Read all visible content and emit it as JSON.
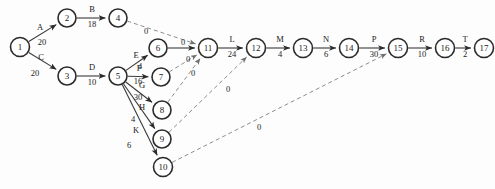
{
  "diagram": {
    "type": "aoa-network",
    "canvas": {
      "width": 495,
      "height": 189
    },
    "colors": {
      "background": "#fdfdfd",
      "node_stroke": "#2b2b2b",
      "node_fill": "#ffffff",
      "edge": "#3a3a3a",
      "dummy_edge": "#8d8d8d",
      "text": "#1a1a1a"
    }
  },
  "nodes": [
    {
      "id": "1",
      "label": "1",
      "x": 20,
      "y": 47,
      "r": 9.5
    },
    {
      "id": "2",
      "label": "2",
      "x": 67,
      "y": 18,
      "r": 9.0
    },
    {
      "id": "3",
      "label": "3",
      "x": 67,
      "y": 76,
      "r": 9.0
    },
    {
      "id": "4",
      "label": "4",
      "x": 118,
      "y": 18,
      "r": 9.0
    },
    {
      "id": "5",
      "label": "5",
      "x": 118,
      "y": 76,
      "r": 9.0
    },
    {
      "id": "6",
      "label": "6",
      "x": 158,
      "y": 48,
      "r": 9.0
    },
    {
      "id": "7",
      "label": "7",
      "x": 161,
      "y": 77,
      "r": 9.0
    },
    {
      "id": "8",
      "label": "8",
      "x": 162,
      "y": 110,
      "r": 9.0
    },
    {
      "id": "9",
      "label": "9",
      "x": 162,
      "y": 139,
      "r": 9.0
    },
    {
      "id": "10",
      "label": "10",
      "x": 163,
      "y": 167,
      "r": 9.5
    },
    {
      "id": "11",
      "label": "11",
      "x": 208,
      "y": 48,
      "r": 9.5
    },
    {
      "id": "12",
      "label": "12",
      "x": 256,
      "y": 48,
      "r": 9.5
    },
    {
      "id": "13",
      "label": "13",
      "x": 303,
      "y": 48,
      "r": 9.5
    },
    {
      "id": "14",
      "label": "14",
      "x": 349,
      "y": 48,
      "r": 9.5
    },
    {
      "id": "15",
      "label": "15",
      "x": 398,
      "y": 48,
      "r": 9.5
    },
    {
      "id": "16",
      "label": "16",
      "x": 445,
      "y": 48,
      "r": 9.5
    },
    {
      "id": "17",
      "label": "17",
      "x": 484,
      "y": 48,
      "r": 9.5
    }
  ],
  "edges": [
    {
      "id": "A",
      "from": "1",
      "to": "2",
      "name": "A",
      "duration": "20",
      "dummy": false,
      "name_x": 40,
      "name_y": 30,
      "dur_x": 42,
      "dur_y": 45
    },
    {
      "id": "B",
      "from": "2",
      "to": "4",
      "name": "B",
      "duration": "18",
      "dummy": false,
      "name_x": 92,
      "name_y": 12,
      "dur_x": 92,
      "dur_y": 27
    },
    {
      "id": "C",
      "from": "1",
      "to": "3",
      "name": "C",
      "duration": "20",
      "dummy": false,
      "name_x": 41,
      "name_y": 60,
      "dur_x": 35,
      "dur_y": 76
    },
    {
      "id": "D",
      "from": "3",
      "to": "5",
      "name": "D",
      "duration": "10",
      "dummy": false,
      "name_x": 92,
      "name_y": 70,
      "dur_x": 92,
      "dur_y": 85
    },
    {
      "id": "E",
      "from": "5",
      "to": "6",
      "name": "E",
      "duration": "4",
      "dummy": false,
      "name_x": 136,
      "name_y": 58,
      "dur_x": 140,
      "dur_y": 69
    },
    {
      "id": "F",
      "from": "5",
      "to": "7",
      "name": "F",
      "duration": "16",
      "dummy": false,
      "name_x": 139,
      "name_y": 71,
      "dur_x": 138,
      "dur_y": 84
    },
    {
      "id": "G",
      "from": "5",
      "to": "8",
      "name": "G",
      "duration": "30",
      "dummy": false,
      "name_x": 142,
      "name_y": 88,
      "dur_x": 138,
      "dur_y": 100
    },
    {
      "id": "H",
      "from": "5",
      "to": "9",
      "name": "H",
      "duration": "4",
      "dummy": false,
      "name_x": 142,
      "name_y": 110,
      "dur_x": 133,
      "dur_y": 122
    },
    {
      "id": "K",
      "from": "5",
      "to": "10",
      "name": "K",
      "duration": "6",
      "dummy": false,
      "name_x": 136,
      "name_y": 133,
      "dur_x": 129,
      "dur_y": 148
    },
    {
      "id": "L",
      "from": "11",
      "to": "12",
      "name": "L",
      "duration": "24",
      "dummy": false,
      "name_x": 232,
      "name_y": 42,
      "dur_x": 232,
      "dur_y": 57
    },
    {
      "id": "M",
      "from": "12",
      "to": "13",
      "name": "M",
      "duration": "4",
      "dummy": false,
      "name_x": 280,
      "name_y": 42,
      "dur_x": 280,
      "dur_y": 57
    },
    {
      "id": "N",
      "from": "13",
      "to": "14",
      "name": "N",
      "duration": "6",
      "dummy": false,
      "name_x": 326,
      "name_y": 42,
      "dur_x": 326,
      "dur_y": 57
    },
    {
      "id": "P",
      "from": "14",
      "to": "15",
      "name": "P",
      "duration": "30",
      "dummy": false,
      "name_x": 374,
      "name_y": 42,
      "dur_x": 374,
      "dur_y": 57
    },
    {
      "id": "R",
      "from": "15",
      "to": "16",
      "name": "R",
      "duration": "10",
      "dummy": false,
      "name_x": 422,
      "name_y": 42,
      "dur_x": 422,
      "dur_y": 57
    },
    {
      "id": "T",
      "from": "16",
      "to": "17",
      "name": "T",
      "duration": "2",
      "dummy": false,
      "name_x": 465,
      "name_y": 42,
      "dur_x": 465,
      "dur_y": 57
    },
    {
      "id": "d1",
      "from": "4",
      "to": "11",
      "name": "",
      "duration": "0",
      "dummy": true,
      "name_x": 0,
      "name_y": 0,
      "dur_x": 146,
      "dur_y": 34
    },
    {
      "id": "d2",
      "from": "6",
      "to": "11",
      "name": "",
      "duration": "0",
      "dummy": false,
      "name_x": 0,
      "name_y": 0,
      "dur_x": 183,
      "dur_y": 45
    },
    {
      "id": "d3",
      "from": "7",
      "to": "11",
      "name": "",
      "duration": "0",
      "dummy": true,
      "name_x": 0,
      "name_y": 0,
      "dur_x": 188,
      "dur_y": 62
    },
    {
      "id": "d4",
      "from": "8",
      "to": "11",
      "name": "",
      "duration": "0",
      "dummy": true,
      "name_x": 0,
      "name_y": 0,
      "dur_x": 193,
      "dur_y": 76
    },
    {
      "id": "d5",
      "from": "9",
      "to": "12",
      "name": "",
      "duration": "0",
      "dummy": true,
      "name_x": 0,
      "name_y": 0,
      "dur_x": 228,
      "dur_y": 92
    },
    {
      "id": "d6",
      "from": "10",
      "to": "15",
      "name": "",
      "duration": "0",
      "dummy": true,
      "name_x": 0,
      "name_y": 0,
      "dur_x": 259,
      "dur_y": 130
    }
  ]
}
